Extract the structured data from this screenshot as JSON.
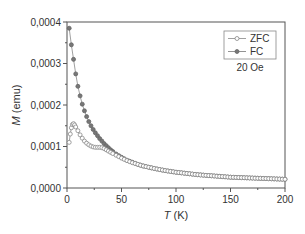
{
  "chart_data": {
    "type": "scatter",
    "title": "",
    "xlabel": "T (K)",
    "xlabel_italic": "T",
    "xlabel_unit": "(K)",
    "ylabel": "M (emu)",
    "ylabel_italic": "M",
    "ylabel_unit": "(emu)",
    "xlim": [
      0,
      200
    ],
    "ylim": [
      0,
      0.0004
    ],
    "xticks": [
      0,
      50,
      100,
      150,
      200
    ],
    "xtick_labels": [
      "0",
      "50",
      "100",
      "150",
      "200"
    ],
    "yticks": [
      0,
      0.0001,
      0.0002,
      0.0003,
      0.0004
    ],
    "ytick_labels": [
      "0,0000",
      "0,0001",
      "0,0002",
      "0,0003",
      "0,0004"
    ],
    "grid": false,
    "legend_position": "upper right",
    "annotation": "20 Oe",
    "series": [
      {
        "name": "ZFC",
        "marker": "open-circle",
        "color": "#888888",
        "x": [
          2,
          3,
          4,
          5,
          6,
          7,
          8,
          10,
          12,
          14,
          16,
          18,
          20,
          22,
          24,
          26,
          28,
          30,
          32,
          34,
          36,
          38,
          40,
          42,
          45,
          50,
          55,
          60,
          65,
          70,
          80,
          90,
          100,
          110,
          120,
          130,
          140,
          150,
          160,
          170,
          180,
          190,
          200
        ],
        "y": [
          0.00011,
          0.00013,
          0.000145,
          0.000153,
          0.000155,
          0.000152,
          0.000147,
          0.000138,
          0.000128,
          0.00012,
          0.000113,
          0.000108,
          0.000104,
          0.000101,
          9.9e-05,
          9.8e-05,
          9.8e-05,
          9.8e-05,
          9.7e-05,
          9.5e-05,
          9.2e-05,
          8.9e-05,
          8.6e-05,
          8.3e-05,
          7.9e-05,
          7.2e-05,
          6.6e-05,
          6.1e-05,
          5.7e-05,
          5.3e-05,
          4.7e-05,
          4.2e-05,
          3.8e-05,
          3.5e-05,
          3.2e-05,
          3e-05,
          2.8e-05,
          2.6e-05,
          2.5e-05,
          2.4e-05,
          2.3e-05,
          2.2e-05,
          2.1e-05
        ]
      },
      {
        "name": "FC",
        "marker": "filled-circle",
        "color": "#777777",
        "x": [
          2,
          4,
          6,
          8,
          10,
          12,
          14,
          16,
          18,
          20,
          22,
          24,
          26,
          28,
          30,
          32,
          34,
          36,
          38,
          40,
          42,
          45,
          50,
          55,
          60,
          65,
          70,
          80,
          90,
          100,
          110,
          120,
          130,
          140,
          150,
          160,
          170,
          180,
          190,
          200
        ],
        "y": [
          0.000385,
          0.000345,
          0.00031,
          0.000275,
          0.000245,
          0.000222,
          0.000202,
          0.000186,
          0.000172,
          0.00016,
          0.00015,
          0.000141,
          0.000133,
          0.000126,
          0.000119,
          0.000113,
          0.000107,
          0.000102,
          9.7e-05,
          9.2e-05,
          8.8e-05,
          8.2e-05,
          7.4e-05,
          6.7e-05,
          6.2e-05,
          5.7e-05,
          5.3e-05,
          4.7e-05,
          4.2e-05,
          3.8e-05,
          3.5e-05,
          3.2e-05,
          3e-05,
          2.8e-05,
          2.6e-05,
          2.5e-05,
          2.4e-05,
          2.3e-05,
          2.2e-05,
          2.1e-05
        ]
      }
    ]
  },
  "legend": {
    "items": [
      {
        "label": "ZFC"
      },
      {
        "label": "FC"
      }
    ],
    "annotation": "20 Oe"
  }
}
